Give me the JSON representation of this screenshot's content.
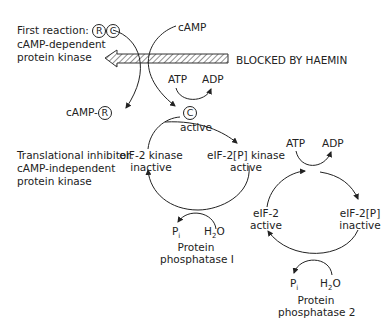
{
  "first_reaction": {
    "label": "First reaction:",
    "regulatory_symbol": "R",
    "catalytic_symbol": "C",
    "line2": "cAMP-dependent",
    "line3": "protein kinase"
  },
  "camp_label": "cAMP",
  "blocked_label": "BLOCKED BY HAEMIN",
  "top_atp": "ATP",
  "top_adp": "ADP",
  "camp_r": {
    "prefix": "cAMP-",
    "symbol": "R"
  },
  "c_active": {
    "symbol": "C",
    "state": "active"
  },
  "translational_inhibitor": {
    "line1": "Translational inhibitor:",
    "line2": "cAMP-independent",
    "line3": "protein kinase"
  },
  "eif2_kinase_inactive": {
    "name": "eIF-2 kinase",
    "state": "inactive"
  },
  "eif2p_kinase_active": {
    "name": "eIF-2[P] kinase",
    "state": "active"
  },
  "phosphatase1": {
    "pi": "P",
    "pi_sub": "i",
    "h2o_pre": "H",
    "h2o_sub": "2",
    "h2o_post": "O",
    "line1": "Protein",
    "line2": "phosphatase I"
  },
  "right_atp": "ATP",
  "right_adp": "ADP",
  "eif2_active": {
    "name": "eIF-2",
    "state": "active"
  },
  "eif2p_inactive": {
    "name": "eIF-2[P]",
    "state": "inactive"
  },
  "phosphatase2": {
    "pi": "P",
    "pi_sub": "i",
    "h2o_pre": "H",
    "h2o_sub": "2",
    "h2o_post": "O",
    "line1": "Protein",
    "line2": "phosphatase 2"
  }
}
